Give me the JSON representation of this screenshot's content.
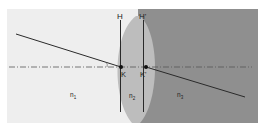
{
  "diagram": {
    "type": "optics-thick-lens-principal-planes",
    "labels": {
      "plane_H": "H",
      "plane_H_prime": "H'",
      "point_K": "K",
      "point_K_prime": "K'",
      "medium_1": "n",
      "medium_1_sub": "1",
      "medium_2": "n",
      "medium_2_sub": "2",
      "medium_3": "n",
      "medium_3_sub": "3"
    },
    "colors": {
      "background": "#ffffff",
      "medium_1": "#eeeeee",
      "medium_2": "#bdbdbd",
      "medium_3": "#8f8f8f",
      "lines": "#2a2a2a",
      "axis": "#555555"
    }
  }
}
